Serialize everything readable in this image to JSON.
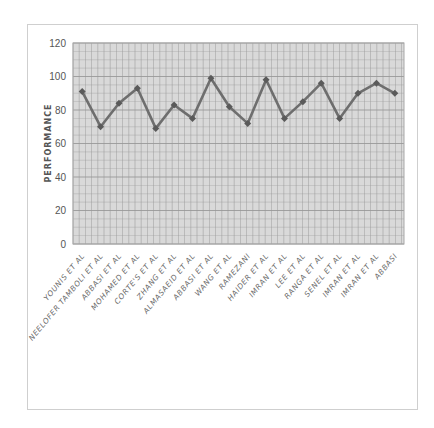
{
  "chart_data": {
    "type": "line",
    "title": "",
    "xlabel": "",
    "ylabel": "PERFORMANCE",
    "ylim": [
      0,
      120
    ],
    "yticks": [
      0,
      20,
      40,
      60,
      80,
      100,
      120
    ],
    "grid": true,
    "legend": "none",
    "categories": [
      "YOUNIS ET AL",
      "NEELOFER TAMBOLI ET AL",
      "ABBASI ET AL",
      "MOHAMED ET AL",
      "CORTE'S ET AL",
      "ZHANG ET AL",
      "ALMASAEID ET AL",
      "ABBASI ET AL",
      "WANG ET AL",
      "RAMEZANI",
      "HAIDER ET AL",
      "IMRAN ET AL",
      "LEE ET AL",
      "RANGA ET AL",
      "SENEL ET AL",
      "IMRAN ET AL",
      "IMRAN ET AL",
      "ABBASI"
    ],
    "series": [
      {
        "name": "Performance",
        "values": [
          91,
          70,
          84,
          93,
          69,
          83,
          75,
          99,
          82,
          72,
          98,
          75,
          85,
          96,
          75,
          90,
          96,
          90
        ]
      }
    ],
    "colors": {
      "line": "#6e6e6e",
      "marker": "#5a5a5a",
      "plot_bg": "#d9d9d9",
      "grid": "#9a9a9a"
    }
  }
}
